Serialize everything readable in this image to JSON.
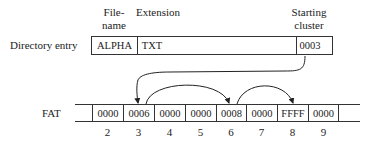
{
  "headers": {
    "filename_line1": "File-",
    "filename_line2": "name",
    "extension": "Extension",
    "starting_line1": "Starting",
    "starting_line2": "cluster"
  },
  "directory_entry": {
    "label": "Directory entry",
    "filename": "ALPHA",
    "extension": "TXT",
    "starting_cluster": "0003"
  },
  "fat": {
    "label": "FAT",
    "entries": [
      {
        "index": "2",
        "value": "0000"
      },
      {
        "index": "3",
        "value": "0006"
      },
      {
        "index": "4",
        "value": "0000"
      },
      {
        "index": "5",
        "value": "0000"
      },
      {
        "index": "6",
        "value": "0008"
      },
      {
        "index": "7",
        "value": "0000"
      },
      {
        "index": "8",
        "value": "FFFF"
      },
      {
        "index": "9",
        "value": "0000"
      }
    ]
  },
  "chain": [
    "0003 -> 3",
    "3 -> 6",
    "6 -> 8"
  ]
}
